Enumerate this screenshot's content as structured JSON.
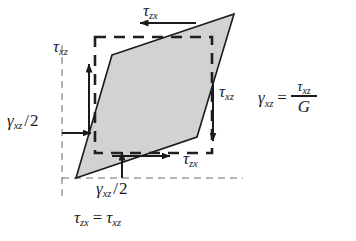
{
  "figure": {
    "type": "shear-strain-diagram",
    "colors": {
      "line": "#1b1b1b",
      "fill": "#d2d2d2",
      "background": "#ffffff",
      "dashed": "#2a2a2a"
    },
    "shapes": {
      "parallelogram": {
        "name": "deformed-element",
        "fill": "#d2d2d2",
        "stroke": "#1b1b1b",
        "points": "112,55 234,14 197,137 76,178"
      },
      "dashed_rectangle": {
        "name": "undeformed-element",
        "stroke": "#2a2a2a",
        "x": 95,
        "y": 37,
        "width": 117,
        "height": 116
      },
      "guide_lines": {
        "vertical_left_x": 62,
        "vertical_left_y1": 45,
        "vertical_left_y2": 195,
        "horizontal_bottom_y": 178,
        "horizontal_bottom_x1": 62,
        "horizontal_bottom_x2": 243
      }
    },
    "arrows": [
      {
        "name": "tau-zx-top-arrow",
        "direction": "left",
        "x1": 196,
        "y1": 23,
        "x2": 138,
        "y2": 23
      },
      {
        "name": "tau-zx-bottom-arrow",
        "direction": "right",
        "x1": 112,
        "y1": 156,
        "x2": 172,
        "y2": 156
      },
      {
        "name": "tau-xz-left-arrow",
        "direction": "up",
        "x1": 89,
        "y1": 135,
        "x2": 89,
        "y2": 62
      },
      {
        "name": "tau-xz-right-arrow",
        "direction": "down",
        "x1": 213,
        "y1": 82,
        "x2": 213,
        "y2": 143
      },
      {
        "name": "gamma-left-angle-arrow",
        "direction": "right",
        "x1": 62,
        "y1": 133,
        "x2": 93,
        "y2": 133
      },
      {
        "name": "gamma-bottom-angle-arrow",
        "direction": "up",
        "x1": 122,
        "y1": 178,
        "x2": 122,
        "y2": 150
      }
    ]
  },
  "labels": {
    "tau_top": {
      "name": "tau-zx-top-label",
      "symbol": "τ",
      "subscript": "zx",
      "x": 143,
      "y": 4
    },
    "tau_bottom": {
      "name": "tau-zx-bottom-label",
      "symbol": "τ",
      "subscript": "zx",
      "x": 181,
      "y": 150
    },
    "tau_left": {
      "name": "tau-xz-left-label",
      "symbol": "τ",
      "subscript": "xz",
      "x": 53,
      "y": 40
    },
    "tau_right": {
      "name": "tau-xz-right-label",
      "symbol": "τ",
      "subscript": "xz",
      "x": 219,
      "y": 83
    },
    "gamma_left": {
      "name": "gamma-xz-half-left-label",
      "symbol": "γ",
      "subscript": "xz",
      "slash": "/",
      "denominator": "2",
      "x": 7,
      "y": 113
    },
    "gamma_bottom": {
      "name": "gamma-xz-half-bottom-label",
      "symbol": "γ",
      "subscript": "xz",
      "slash": "/",
      "denominator": "2",
      "x": 96,
      "y": 180
    }
  },
  "equations": {
    "hookes_shear_law": {
      "name": "shear-strain-equation",
      "lhs_symbol": "γ",
      "lhs_subscript": "xz",
      "equals": "=",
      "numerator_symbol": "τ",
      "numerator_subscript": "xz",
      "denominator": "G",
      "x": 258,
      "y": 88
    },
    "complementary_shear": {
      "name": "complementary-shear-equation",
      "lhs_symbol": "τ",
      "lhs_subscript": "zx",
      "equals": "=",
      "rhs_symbol": "τ",
      "rhs_subscript": "xz",
      "x": 74,
      "y": 211
    }
  }
}
